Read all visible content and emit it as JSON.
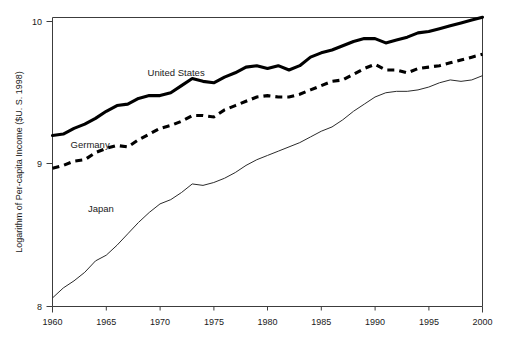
{
  "chart_data": {
    "type": "line",
    "title": "",
    "subtitle": "",
    "xlabel": "",
    "ylabel": "Logarithm of Per-capita Income ($U. S. 1998)",
    "xlim": [
      1960,
      2000
    ],
    "ylim": [
      8,
      10
    ],
    "grid": false,
    "legend_position": "inline-annotations",
    "xticks": [
      1960,
      1965,
      1970,
      1975,
      1980,
      1985,
      1990,
      1995,
      2000
    ],
    "xtick_labels": [
      "1960",
      "1965",
      "1970",
      "1975",
      "1980",
      "1985",
      "1990",
      "1995",
      "2000"
    ],
    "yticks": [
      8,
      9,
      10
    ],
    "ytick_labels": [
      "8",
      "9",
      "10"
    ],
    "x": [
      1960,
      1961,
      1962,
      1963,
      1964,
      1965,
      1966,
      1967,
      1968,
      1969,
      1970,
      1971,
      1972,
      1973,
      1974,
      1975,
      1976,
      1977,
      1978,
      1979,
      1980,
      1981,
      1982,
      1983,
      1984,
      1985,
      1986,
      1987,
      1988,
      1989,
      1990,
      1991,
      1992,
      1993,
      1994,
      1995,
      1996,
      1997,
      1998,
      1999,
      2000
    ],
    "series": [
      {
        "name": "United States",
        "style": "thick-solid",
        "color": "#000000",
        "label_x": 1971.5,
        "label_y": 9.62,
        "values": [
          9.2,
          9.21,
          9.25,
          9.28,
          9.32,
          9.37,
          9.41,
          9.42,
          9.46,
          9.48,
          9.48,
          9.5,
          9.55,
          9.6,
          9.58,
          9.57,
          9.61,
          9.64,
          9.68,
          9.69,
          9.67,
          9.69,
          9.66,
          9.69,
          9.75,
          9.78,
          9.8,
          9.83,
          9.86,
          9.88,
          9.88,
          9.85,
          9.87,
          9.89,
          9.92,
          9.93,
          9.95,
          9.97,
          9.99,
          10.01,
          10.03
        ]
      },
      {
        "name": "Germany",
        "style": "thick-dashed",
        "color": "#000000",
        "label_x": 1963.5,
        "label_y": 9.11,
        "values": [
          8.97,
          8.99,
          9.02,
          9.03,
          9.08,
          9.11,
          9.13,
          9.12,
          9.17,
          9.21,
          9.25,
          9.27,
          9.3,
          9.34,
          9.34,
          9.33,
          9.38,
          9.41,
          9.44,
          9.47,
          9.48,
          9.47,
          9.47,
          9.49,
          9.52,
          9.55,
          9.58,
          9.59,
          9.63,
          9.67,
          9.7,
          9.66,
          9.66,
          9.64,
          9.67,
          9.68,
          9.69,
          9.71,
          9.73,
          9.75,
          9.77
        ]
      },
      {
        "name": "Japan",
        "style": "thin-solid",
        "color": "#2b2b2b",
        "label_x": 1964.5,
        "label_y": 8.66,
        "values": [
          8.06,
          8.13,
          8.18,
          8.24,
          8.32,
          8.36,
          8.43,
          8.51,
          8.59,
          8.66,
          8.72,
          8.75,
          8.8,
          8.86,
          8.85,
          8.87,
          8.9,
          8.94,
          8.99,
          9.03,
          9.06,
          9.09,
          9.12,
          9.15,
          9.19,
          9.23,
          9.26,
          9.31,
          9.37,
          9.42,
          9.47,
          9.5,
          9.51,
          9.51,
          9.52,
          9.54,
          9.57,
          9.59,
          9.58,
          9.59,
          9.62
        ]
      }
    ]
  },
  "axes": {
    "y_axis_title": "Logarithm of Per-capita Income ($U. S. 1998)"
  }
}
